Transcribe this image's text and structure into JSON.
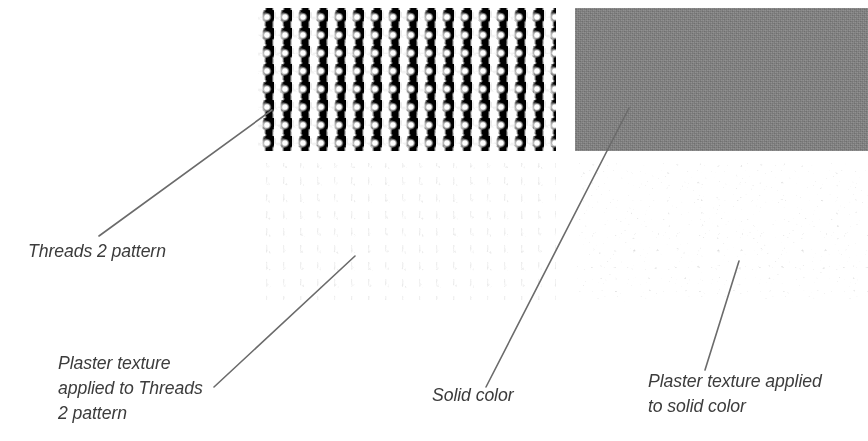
{
  "figure": {
    "background_color": "#ffffff",
    "width": 868,
    "height": 441
  },
  "swatches": [
    {
      "id": "threads-2-pattern",
      "name": "Threads 2 pattern",
      "description": "high contrast black and white woven grid pattern",
      "position": "top-left"
    },
    {
      "id": "solid-color",
      "name": "Solid color",
      "description": "flat medium gray fill",
      "color": "#808080",
      "position": "top-right"
    },
    {
      "id": "threads-2-pattern-plaster",
      "name": "Plaster texture applied to Threads 2 pattern",
      "description": "washed out embossed grid pattern",
      "position": "bottom-left"
    },
    {
      "id": "solid-color-plaster",
      "name": "Plaster texture applied to solid color",
      "description": "light bumpy stucco texture",
      "position": "bottom-right"
    }
  ],
  "captions": {
    "threads": "Threads 2 pattern",
    "threads_plaster": "Plaster texture\napplied to Threads\n2 pattern",
    "solid": "Solid color",
    "solid_plaster": "Plaster texture applied\nto solid color"
  },
  "leader_lines": {
    "color": "#6b6b6b",
    "width": 1.6,
    "lines": [
      {
        "target": "threads-2-pattern",
        "x1": 99,
        "y1": 236,
        "x2": 272,
        "y2": 110
      },
      {
        "target": "threads-2-pattern-plaster",
        "x1": 214,
        "y1": 387,
        "x2": 355,
        "y2": 256
      },
      {
        "target": "solid-color",
        "x1": 486,
        "y1": 387,
        "x2": 629,
        "y2": 108
      },
      {
        "target": "solid-color-plaster",
        "x1": 705,
        "y1": 370,
        "x2": 739,
        "y2": 261
      }
    ]
  }
}
